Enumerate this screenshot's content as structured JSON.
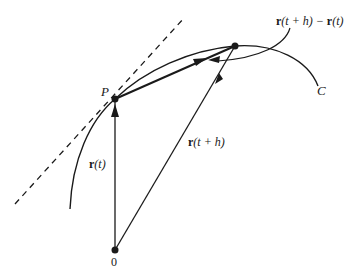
{
  "diagram": {
    "title": "",
    "type": "vector-derivative-secant",
    "nodes": [
      {
        "id": "O",
        "label": "0",
        "x": 115,
        "y": 250
      },
      {
        "id": "P",
        "label": "P",
        "x": 115,
        "y": 99
      },
      {
        "id": "Q",
        "label": "",
        "x": 235,
        "y": 46
      }
    ],
    "curve": {
      "label": "C"
    },
    "vectors": [
      {
        "from": "O",
        "to": "P",
        "label_bold": "r",
        "label_rest": "(t)"
      },
      {
        "from": "O",
        "to": "Q",
        "label_bold": "r",
        "label_rest": "(t + h)"
      },
      {
        "from": "P",
        "to": "Q",
        "label_bold": "r",
        "label_rest": "(t + h) − ",
        "label_bold2": "r",
        "label_rest2": "(t)"
      }
    ],
    "tangent_line": {
      "style": "dashed"
    },
    "labels": {
      "origin": "0",
      "point_p": "P",
      "curve": "C",
      "r_t_bold": "r",
      "r_t_rest": "(t)",
      "r_th_bold": "r",
      "r_th_rest": "(t + h)",
      "diff_bold1": "r",
      "diff_mid": "(t + h) − ",
      "diff_bold2": "r",
      "diff_end": "(t)"
    },
    "colors": {
      "stroke": "#1a1a1a",
      "background": "#ffffff"
    }
  }
}
